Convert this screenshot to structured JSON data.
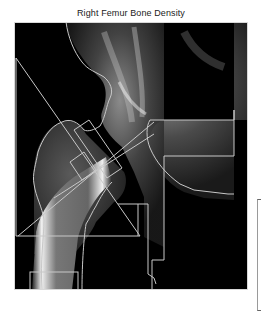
{
  "figure": {
    "title": "Right Femur Bone Density",
    "image_description": "DXA scan of right proximal femur with region-of-interest overlays",
    "background_color": "#ffffff",
    "scan_background": "#000000",
    "overlay_color": "#c8c8c8"
  },
  "overlays": {
    "items": [
      {
        "name": "femur-contour",
        "type": "outline"
      },
      {
        "name": "ward-triangle",
        "type": "triangle"
      },
      {
        "name": "femoral-neck-box",
        "type": "rotated-rectangle"
      },
      {
        "name": "neck-axis-line",
        "type": "line"
      },
      {
        "name": "trochanter-region",
        "type": "stepped-outline"
      },
      {
        "name": "shaft-region",
        "type": "rectangle"
      }
    ]
  },
  "scale_bar": {
    "visible": true
  }
}
